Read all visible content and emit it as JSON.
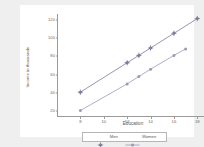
{
  "chart_data": {
    "type": "line",
    "title": "",
    "xlabel": "Education",
    "ylabel": "Income in thousands",
    "xlim": [
      6,
      19
    ],
    "ylim": [
      14,
      126
    ],
    "xticks": [
      8,
      10,
      12,
      14,
      16,
      18
    ],
    "yticks": [
      20,
      40,
      60,
      80,
      100,
      120
    ],
    "grid": false,
    "legend_position": "bottom",
    "series": [
      {
        "name": "Men",
        "color": "#7b7b9e",
        "marker": "diamond-cross",
        "x": [
          8,
          12,
          13,
          14,
          16,
          18
        ],
        "y": [
          41,
          73,
          81,
          89,
          105,
          121
        ]
      },
      {
        "name": "Women",
        "color": "#9a9ab5",
        "marker": "circle",
        "x": [
          8,
          12,
          13,
          14,
          16,
          17
        ],
        "y": [
          21,
          50,
          58,
          66,
          81,
          88
        ]
      }
    ]
  },
  "axes": {
    "x_title": "Education",
    "y_title": "Income in thousands",
    "x_tick_labels": [
      "8",
      "10",
      "12",
      "14",
      "16",
      "18"
    ],
    "y_tick_labels": [
      "20",
      "40",
      "60",
      "80",
      "100",
      "120"
    ]
  },
  "legend": {
    "entries": [
      {
        "label": "Men"
      },
      {
        "label": "Women"
      }
    ]
  },
  "colors": {
    "men": "#7b7b9e",
    "women": "#9a9ab5",
    "axis": "#9a9a9a",
    "text": "#5a5a5a",
    "page_background": "#efefef",
    "plot_background": "#ffffff"
  }
}
